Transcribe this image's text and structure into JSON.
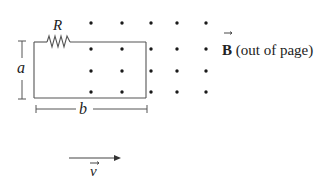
{
  "diagram": {
    "resistor_label": "R",
    "height_label": "a",
    "width_label": "b",
    "field_symbol": "B",
    "field_description": " (out of page)",
    "velocity_label": "v",
    "colors": {
      "line": "#555555",
      "dot": "#1a1a1a",
      "text": "#222222"
    },
    "field_dots": {
      "columns_x": [
        91,
        122,
        151,
        177,
        206
      ],
      "rows_y": [
        23,
        49,
        71,
        92
      ]
    }
  }
}
